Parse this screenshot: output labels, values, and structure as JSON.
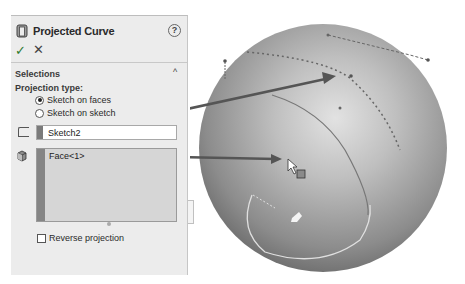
{
  "property_manager": {
    "title": "Projected Curve",
    "icons": {
      "feature": "projected-curve-icon",
      "help": "?",
      "ok": "✓",
      "cancel": "✕"
    },
    "selections_section": {
      "title": "Selections",
      "collapse_glyph": "^",
      "projection_type_label": "Projection type:",
      "projection_options": [
        {
          "label": "Sketch on faces",
          "checked": true
        },
        {
          "label": "Sketch on sketch",
          "checked": false
        }
      ],
      "sketch_field": {
        "value": "Sketch2"
      },
      "faces_list": {
        "items": [
          "Face<1>"
        ]
      },
      "reverse_projection": {
        "label": "Reverse projection",
        "checked": false
      }
    }
  },
  "viewport": {
    "model": "sphere",
    "callouts": [
      {
        "from": "Sketch2",
        "to": "sketch-curve-on-sphere"
      },
      {
        "from": "Face<1>",
        "to": "sphere-face"
      }
    ],
    "colors": {
      "sphere_light": "#d8d8d8",
      "sphere_dark": "#5e5e5e",
      "arrow": "#555555"
    }
  }
}
